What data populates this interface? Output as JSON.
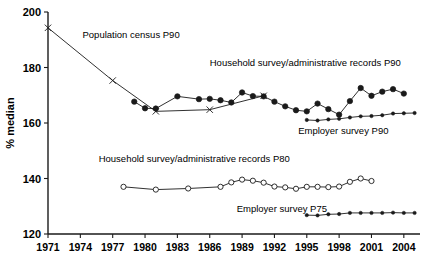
{
  "chart_data": {
    "type": "line",
    "title": "",
    "xlabel": "",
    "ylabel": "% median",
    "xlim": [
      1971,
      2005.5
    ],
    "ylim": [
      120,
      200
    ],
    "yticks": [
      120,
      140,
      160,
      180,
      200
    ],
    "xticks": [
      1971,
      1974,
      1977,
      1980,
      1983,
      1986,
      1989,
      1992,
      1995,
      1998,
      2001,
      2004
    ],
    "grid": false,
    "legend_position": "inline-annotations",
    "series": [
      {
        "name": "Population census P90",
        "marker": "cross",
        "label_x": 1974.2,
        "label_y": 190.5,
        "points": [
          {
            "x": 1971,
            "y": 194.3
          },
          {
            "x": 1977,
            "y": 175.3
          },
          {
            "x": 1981,
            "y": 164.2
          },
          {
            "x": 1986,
            "y": 164.8
          },
          {
            "x": 1991,
            "y": 169.8
          }
        ]
      },
      {
        "name": "Household survey/administrative records P90",
        "marker": "filled-circle",
        "label_x": 1986.0,
        "label_y": 180.7,
        "points": [
          {
            "x": 1979,
            "y": 167.7
          },
          {
            "x": 1980,
            "y": 165.3
          },
          {
            "x": 1981,
            "y": 165.2
          },
          {
            "x": 1983,
            "y": 169.6
          },
          {
            "x": 1985,
            "y": 168.6
          },
          {
            "x": 1986,
            "y": 168.7
          },
          {
            "x": 1987,
            "y": 168.2
          },
          {
            "x": 1988,
            "y": 167.4
          },
          {
            "x": 1989,
            "y": 171.0
          },
          {
            "x": 1990,
            "y": 169.7
          },
          {
            "x": 1991,
            "y": 169.6
          },
          {
            "x": 1992,
            "y": 167.7
          },
          {
            "x": 1993,
            "y": 166.0
          },
          {
            "x": 1994,
            "y": 164.6
          },
          {
            "x": 1995,
            "y": 164.2
          },
          {
            "x": 1996,
            "y": 167.0
          },
          {
            "x": 1997,
            "y": 165.0
          },
          {
            "x": 1998,
            "y": 163.0
          },
          {
            "x": 1999,
            "y": 167.9
          },
          {
            "x": 2000,
            "y": 172.6
          },
          {
            "x": 2001,
            "y": 169.8
          },
          {
            "x": 2002,
            "y": 171.3
          },
          {
            "x": 2003,
            "y": 172.2
          },
          {
            "x": 2004,
            "y": 170.6
          }
        ]
      },
      {
        "name": "Employer survey P90",
        "marker": "small-filled",
        "label_x": 1994.2,
        "label_y": 156.2,
        "points": [
          {
            "x": 1995,
            "y": 161.1
          },
          {
            "x": 1996,
            "y": 160.9
          },
          {
            "x": 1997,
            "y": 161.3
          },
          {
            "x": 1998,
            "y": 161.5
          },
          {
            "x": 1999,
            "y": 162.0
          },
          {
            "x": 2000,
            "y": 162.4
          },
          {
            "x": 2001,
            "y": 162.5
          },
          {
            "x": 2002,
            "y": 162.8
          },
          {
            "x": 2003,
            "y": 163.4
          },
          {
            "x": 2004,
            "y": 163.5
          },
          {
            "x": 2005,
            "y": 163.6
          }
        ]
      },
      {
        "name": "Household survey/administrative records P80",
        "marker": "open-circle",
        "label_x": 1975.7,
        "label_y": 146.0,
        "points": [
          {
            "x": 1978,
            "y": 137.0
          },
          {
            "x": 1981,
            "y": 136.0
          },
          {
            "x": 1984,
            "y": 136.4
          },
          {
            "x": 1987,
            "y": 137.0
          },
          {
            "x": 1988,
            "y": 138.6
          },
          {
            "x": 1989,
            "y": 139.6
          },
          {
            "x": 1990,
            "y": 139.2
          },
          {
            "x": 1991,
            "y": 138.5
          },
          {
            "x": 1992,
            "y": 137.1
          },
          {
            "x": 1993,
            "y": 136.8
          },
          {
            "x": 1994,
            "y": 136.3
          },
          {
            "x": 1995,
            "y": 137.0
          },
          {
            "x": 1996,
            "y": 137.0
          },
          {
            "x": 1997,
            "y": 136.9
          },
          {
            "x": 1998,
            "y": 137.1
          },
          {
            "x": 1999,
            "y": 138.8
          },
          {
            "x": 2000,
            "y": 140.0
          },
          {
            "x": 2001,
            "y": 139.1
          }
        ]
      },
      {
        "name": "Employer survey P75",
        "marker": "small-filled",
        "label_x": 1988.5,
        "label_y": 128.0,
        "points": [
          {
            "x": 1995,
            "y": 126.8
          },
          {
            "x": 1996,
            "y": 126.7
          },
          {
            "x": 1997,
            "y": 127.1
          },
          {
            "x": 1998,
            "y": 127.2
          },
          {
            "x": 1999,
            "y": 127.6
          },
          {
            "x": 2000,
            "y": 127.6
          },
          {
            "x": 2001,
            "y": 127.6
          },
          {
            "x": 2002,
            "y": 127.6
          },
          {
            "x": 2003,
            "y": 127.7
          },
          {
            "x": 2004,
            "y": 127.6
          },
          {
            "x": 2005,
            "y": 127.6
          }
        ]
      }
    ],
    "colors": {
      "line": "#1a1a1a",
      "marker_fill": "#1a1a1a",
      "marker_open_fill": "#ffffff",
      "background": "#ffffff"
    }
  }
}
